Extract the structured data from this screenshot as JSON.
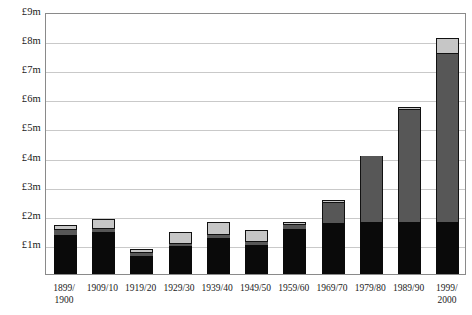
{
  "chart_data": {
    "type": "bar",
    "subtype": "stacked-bar",
    "title": "",
    "xlabel": "",
    "ylabel": "",
    "categories": [
      "1899/\n1900",
      "1909/10",
      "1919/20",
      "1929/30",
      "1939/40",
      "1949/50",
      "1959/60",
      "1969/70",
      "1979/80",
      "1989/90",
      "1999/\n2000"
    ],
    "ylim": [
      0,
      9
    ],
    "ytick_values": [
      1,
      2,
      3,
      4,
      5,
      6,
      7,
      8,
      9
    ],
    "ytick_labels": [
      "£1m",
      "£2m",
      "£3m",
      "£4m",
      "£5m",
      "£6m",
      "£7m",
      "£8m",
      "£9m"
    ],
    "grid": true,
    "legend": "none",
    "unit": "£m",
    "series": [
      {
        "name": "bottom-segment",
        "color": "#0a0a0a",
        "values": [
          1.35,
          1.45,
          0.62,
          0.97,
          1.25,
          1.0,
          1.55,
          1.75,
          1.8,
          1.8,
          1.8
        ]
      },
      {
        "name": "middle-segment",
        "color": "#575757",
        "values": [
          0.17,
          0.1,
          0.1,
          0.08,
          0.1,
          0.1,
          0.12,
          0.7,
          2.25,
          3.85,
          5.75
        ]
      },
      {
        "name": "top-segment",
        "color": "#c6c6c6",
        "values": [
          0.18,
          0.35,
          0.13,
          0.4,
          0.45,
          0.4,
          0.13,
          0.1,
          0.0,
          0.1,
          0.55
        ]
      }
    ],
    "totals": [
      1.7,
      1.9,
      0.85,
      1.45,
      1.8,
      1.5,
      1.8,
      2.55,
      4.05,
      5.75,
      8.1
    ]
  },
  "axis": {
    "y_title": "",
    "x_title": ""
  }
}
